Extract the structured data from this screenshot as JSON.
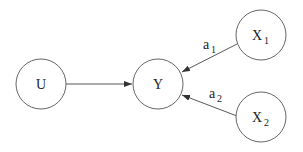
{
  "diagram": {
    "nodes": [
      {
        "id": "U",
        "label": "U",
        "subscript": ""
      },
      {
        "id": "Y",
        "label": "Y",
        "subscript": ""
      },
      {
        "id": "X1",
        "label": "X",
        "subscript": "1"
      },
      {
        "id": "X2",
        "label": "X",
        "subscript": "2"
      }
    ],
    "edges": [
      {
        "from": "U",
        "to": "Y",
        "label": "",
        "subscript": ""
      },
      {
        "from": "X1",
        "to": "Y",
        "label": "a",
        "subscript": "1"
      },
      {
        "from": "X2",
        "to": "Y",
        "label": "a",
        "subscript": "2"
      }
    ]
  }
}
